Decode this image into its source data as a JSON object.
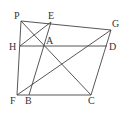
{
  "diagram": {
    "type": "geometry",
    "stroke_color": "#444444",
    "label_color": "#333333",
    "points": {
      "P": {
        "x": 21,
        "y": 21,
        "label": "P",
        "lx": 14,
        "ly": 19
      },
      "E": {
        "x": 51,
        "y": 22,
        "label": "E",
        "lx": 48,
        "ly": 19
      },
      "G": {
        "x": 111,
        "y": 30,
        "label": "G",
        "lx": 112,
        "ly": 27
      },
      "H": {
        "x": 20,
        "y": 46,
        "label": "H",
        "lx": 9,
        "ly": 50
      },
      "A": {
        "x": 44,
        "y": 46,
        "label": "A",
        "lx": 46,
        "ly": 44
      },
      "D": {
        "x": 107,
        "y": 46,
        "label": "D",
        "lx": 109,
        "ly": 50
      },
      "F": {
        "x": 17,
        "y": 95,
        "label": "F",
        "lx": 10,
        "ly": 104
      },
      "B": {
        "x": 29,
        "y": 95,
        "label": "B",
        "lx": 25,
        "ly": 104
      },
      "C": {
        "x": 91,
        "y": 95,
        "label": "C",
        "lx": 88,
        "ly": 104
      }
    },
    "segments": [
      [
        "P",
        "G"
      ],
      [
        "P",
        "F"
      ],
      [
        "H",
        "D"
      ],
      [
        "F",
        "C"
      ],
      [
        "C",
        "G"
      ],
      [
        "P",
        "C"
      ],
      [
        "H",
        "E"
      ],
      [
        "B",
        "E"
      ],
      [
        "F",
        "G"
      ]
    ]
  }
}
